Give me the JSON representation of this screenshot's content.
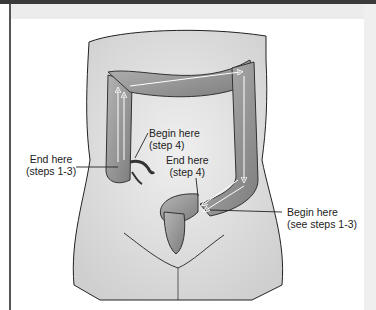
{
  "figure": {
    "labels": [
      {
        "id": "end-steps-1-3",
        "line1": "End here",
        "line2": "(steps 1-3)"
      },
      {
        "id": "begin-step-4",
        "line1": "Begin here",
        "line2": "(step 4)"
      },
      {
        "id": "end-step-4",
        "line1": "End here",
        "line2": "(step 4)"
      },
      {
        "id": "begin-steps-1-3",
        "line1": "Begin here",
        "line2": "(see steps 1-3)"
      }
    ]
  },
  "colors": {
    "frame_top": "#3a3a3a",
    "frame_left": "#555555",
    "body_fill": "#e6e6e6",
    "colon_fill": "#9a9a9a",
    "outline": "#222222",
    "arrow": "#ffffff"
  }
}
